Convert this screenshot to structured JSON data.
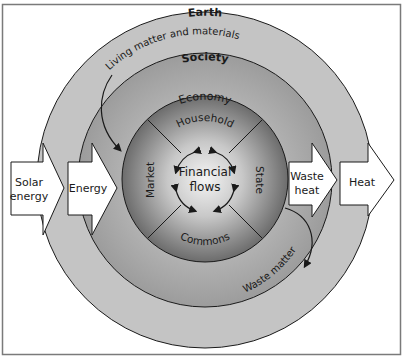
{
  "diagram": {
    "rings": {
      "earth": {
        "label": "Earth",
        "fill": "#c4c4c4"
      },
      "society": {
        "label": "Society",
        "fill": "#a9a9a9"
      },
      "economy": {
        "label": "Economy",
        "fill_edge": "#6f6f6f",
        "fill_center": "#f2f2f2"
      }
    },
    "sectors": {
      "top": "Household",
      "right": "State",
      "bottom": "Commons",
      "left": "Market"
    },
    "center": {
      "line1": "Financial",
      "line2": "flows"
    },
    "flows": {
      "inflow_materials": "Living matter and materials",
      "outflow_materials": "Waste matter"
    },
    "arrows": {
      "solar": {
        "line1": "Solar",
        "line2": "energy"
      },
      "energy": {
        "label": "Energy"
      },
      "waste_heat": {
        "line1": "Waste",
        "line2": "heat"
      },
      "heat": {
        "label": "Heat"
      }
    },
    "colors": {
      "frame": "#7a7a7a",
      "stroke": "#1a1a1a",
      "arrow_fill": "#ffffff"
    }
  }
}
